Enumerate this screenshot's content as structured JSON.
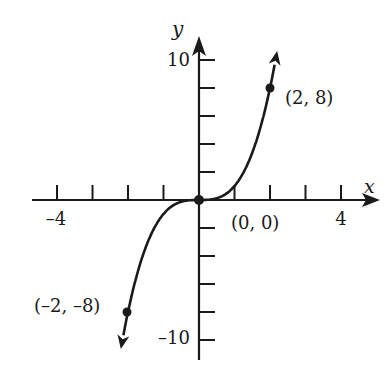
{
  "chart_data": {
    "type": "line",
    "title": "",
    "function": "y = x^3",
    "xlabel": "x",
    "ylabel": "y",
    "xlim": [
      -4,
      4
    ],
    "ylim": [
      -10,
      10
    ],
    "x_tick_step": 1,
    "y_tick_step": 2,
    "x_tick_labels": [
      {
        "value": -4,
        "label": "–4"
      },
      {
        "value": 4,
        "label": "4"
      }
    ],
    "y_tick_labels": [
      {
        "value": 10,
        "label": "10"
      },
      {
        "value": -10,
        "label": "–10"
      }
    ],
    "grid": false,
    "series": [
      {
        "name": "y = x^3",
        "x": [
          -2,
          -1.5,
          -1,
          -0.5,
          0,
          0.5,
          1,
          1.5,
          2
        ],
        "y": [
          -8,
          -3.375,
          -1,
          -0.125,
          0,
          0.125,
          1,
          3.375,
          8
        ],
        "arrows_at_ends": true
      }
    ],
    "points": [
      {
        "x": -2,
        "y": -8,
        "label": "(–2, –8)"
      },
      {
        "x": 0,
        "y": 0,
        "label": "(0, 0)"
      },
      {
        "x": 2,
        "y": 8,
        "label": "(2, 8)"
      }
    ]
  }
}
